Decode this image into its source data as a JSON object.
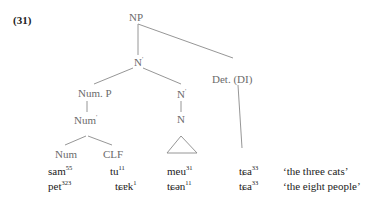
{
  "example_number": "(31)",
  "tree": {
    "root": "NP",
    "n_bar_top": "N",
    "num_p": "Num. P",
    "n_bar_right": "N",
    "det": "Det. (DI)",
    "num_bar": "Num",
    "n": "N",
    "num": "Num",
    "clf": "CLF",
    "prime": "'"
  },
  "rows": [
    {
      "num": {
        "base": "sam",
        "tone": "55"
      },
      "clf": {
        "base": "tu",
        "tone": "11"
      },
      "noun": {
        "base": "meu",
        "tone": "31"
      },
      "det": {
        "base": "tɕa",
        "tone": "33"
      },
      "gloss": "‘the three cats’"
    },
    {
      "num": {
        "base": "pet",
        "tone": "323"
      },
      "clf": {
        "base": "tɕɐk",
        "tone": "1"
      },
      "noun": {
        "base": "tɕən",
        "tone": "11"
      },
      "det": {
        "base": "tɕa",
        "tone": "33"
      },
      "gloss": "‘the eight people’"
    }
  ],
  "colors": {
    "node_label": "#6b6b6b",
    "branch": "#888888",
    "text": "#222222"
  }
}
